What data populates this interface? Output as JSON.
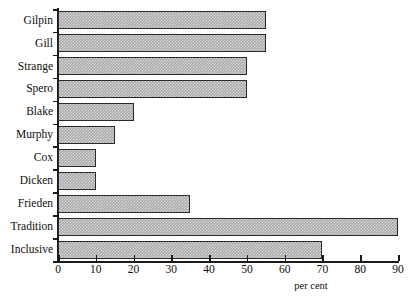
{
  "chart_data": {
    "type": "bar",
    "orientation": "horizontal",
    "title": "",
    "xlabel": "per cent",
    "ylabel": "",
    "xlim": [
      0,
      90
    ],
    "ylim": null,
    "grid": false,
    "legend": null,
    "xticks": [
      0,
      10,
      20,
      30,
      40,
      50,
      60,
      70,
      80,
      90
    ],
    "xtick_labels": [
      "0",
      "10",
      "20",
      "30",
      "40",
      "50",
      "60",
      "70",
      "80",
      "90"
    ],
    "categories": [
      "Gilpin",
      "Gill",
      "Strange",
      "Spero",
      "Blake",
      "Murphy",
      "Cox",
      "Dicken",
      "Frieden",
      "Tradition",
      "Inclusive"
    ],
    "values": [
      55,
      55,
      50,
      50,
      20,
      15,
      10,
      10,
      35,
      90,
      70
    ],
    "bar_fill": "#a8a8a8",
    "bar_edge": "#2a2a2a",
    "axis_color": "#1a1a1a",
    "background": "#ffffff"
  }
}
